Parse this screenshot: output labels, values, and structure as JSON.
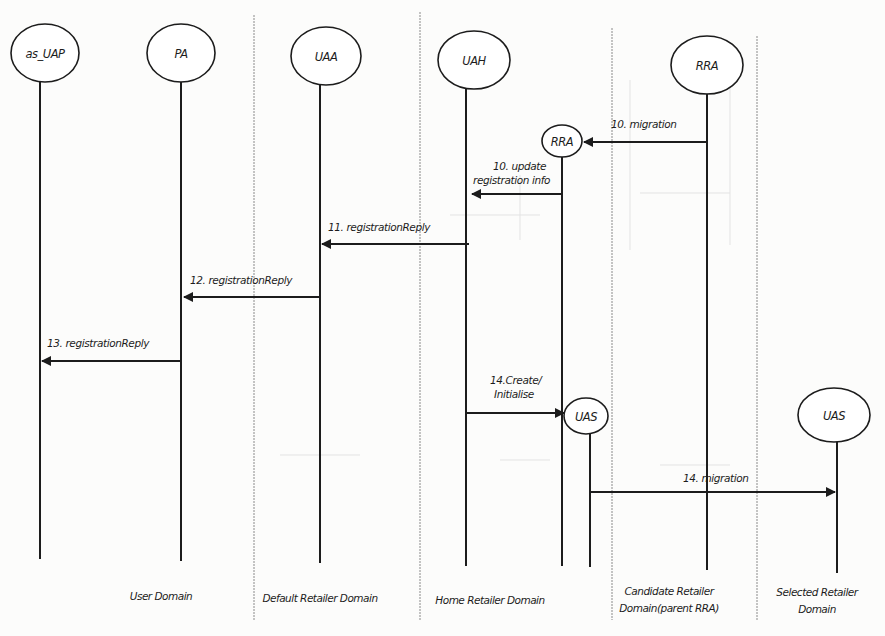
{
  "diagram": {
    "type": "sequence-diagram",
    "actors": [
      {
        "id": "as_uap",
        "label": "as_UAP",
        "cx": 45,
        "cy": 53,
        "rx": 34,
        "ry": 29,
        "lifeline_x": 40,
        "lifeline_top": 80,
        "lifeline_bottom": 559
      },
      {
        "id": "pa",
        "label": "PA",
        "cx": 181,
        "cy": 53,
        "rx": 34,
        "ry": 29,
        "lifeline_x": 181,
        "lifeline_top": 81,
        "lifeline_bottom": 561
      },
      {
        "id": "uaa",
        "label": "UAA",
        "cx": 326,
        "cy": 56,
        "rx": 35,
        "ry": 29,
        "lifeline_x": 320,
        "lifeline_top": 84,
        "lifeline_bottom": 563
      },
      {
        "id": "uah",
        "label": "UAH",
        "cx": 474,
        "cy": 60,
        "rx": 36,
        "ry": 29,
        "lifeline_x": 466,
        "lifeline_top": 88,
        "lifeline_bottom": 566
      },
      {
        "id": "rra",
        "label": "RRA",
        "cx": 707,
        "cy": 65,
        "rx": 36,
        "ry": 29,
        "lifeline_x": 707,
        "lifeline_top": 93,
        "lifeline_bottom": 570
      },
      {
        "id": "rra_inner",
        "label": "RRA",
        "cx": 562,
        "cy": 141,
        "rx": 20,
        "ry": 16,
        "lifeline_x": 562,
        "lifeline_top": 157,
        "lifeline_bottom": 566
      },
      {
        "id": "uas_inner",
        "label": "UAS",
        "cx": 586,
        "cy": 416,
        "rx": 22,
        "ry": 18,
        "lifeline_x": 590,
        "lifeline_top": 434,
        "lifeline_bottom": 567
      },
      {
        "id": "uas_selected",
        "label": "UAS",
        "cx": 834,
        "cy": 415,
        "rx": 36,
        "ry": 27,
        "lifeline_x": 837,
        "lifeline_top": 442,
        "lifeline_bottom": 573
      }
    ],
    "separators": [
      {
        "x": 254,
        "top": 15,
        "bottom": 620
      },
      {
        "x": 420,
        "top": 12,
        "bottom": 620
      },
      {
        "x": 612,
        "top": 28,
        "bottom": 620
      },
      {
        "x": 757,
        "top": 36,
        "bottom": 620
      }
    ],
    "messages": [
      {
        "id": "msg-10-migration",
        "label_lines": [
          "10. migration"
        ],
        "y": 142,
        "from_x": 707,
        "to_x": 584,
        "label_x": 611,
        "label_y": 128
      },
      {
        "id": "msg-10-update",
        "label_lines": [
          "10. update",
          "registration info"
        ],
        "y": 194,
        "from_x": 562,
        "to_x": 472,
        "label_x": 493,
        "label_y": 170
      },
      {
        "id": "msg-11",
        "label_lines": [
          "11. registrationReply"
        ],
        "y": 244,
        "from_x": 469,
        "to_x": 322,
        "label_x": 328,
        "label_y": 231
      },
      {
        "id": "msg-12",
        "label_lines": [
          "12. registrationReply"
        ],
        "y": 297,
        "from_x": 320,
        "to_x": 184,
        "label_x": 190,
        "label_y": 284
      },
      {
        "id": "msg-13",
        "label_lines": [
          "13. registrationReply"
        ],
        "y": 361,
        "from_x": 181,
        "to_x": 42,
        "label_x": 47,
        "label_y": 347
      },
      {
        "id": "msg-14-create",
        "label_lines": [
          "14.Create/",
          "Initialise"
        ],
        "y": 413,
        "from_x": 466,
        "to_x": 564,
        "label_x": 490,
        "label_y": 384
      },
      {
        "id": "msg-14-migration",
        "label_lines": [
          "14. migration"
        ],
        "y": 492,
        "from_x": 590,
        "to_x": 835,
        "label_x": 683,
        "label_y": 482
      }
    ],
    "domains": [
      {
        "id": "user-domain",
        "lines": [
          "User Domain"
        ],
        "cx": 161,
        "y": 600
      },
      {
        "id": "default-retailer-domain",
        "lines": [
          "Default Retailer Domain"
        ],
        "cx": 320,
        "y": 602
      },
      {
        "id": "home-retailer-domain",
        "lines": [
          "Home Retailer Domain"
        ],
        "cx": 490,
        "y": 604
      },
      {
        "id": "candidate-retailer-domain",
        "lines": [
          "Candidate Retailer",
          "Domain(parent RRA)"
        ],
        "cx": 669,
        "y": 595
      },
      {
        "id": "selected-retailer-domain",
        "lines": [
          "Selected Retailer",
          "Domain"
        ],
        "cx": 817,
        "y": 596
      }
    ],
    "colors": {
      "ink": "#1c1c1c",
      "paper": "#fcfcfb",
      "separator": "#8a8a8a",
      "bleed_through": "#dcdcdc"
    }
  }
}
